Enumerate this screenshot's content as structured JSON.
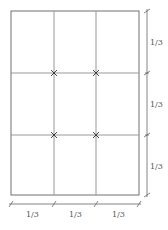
{
  "diagram": {
    "colors": {
      "background": "#ffffff",
      "frame": "#707070",
      "grid": "#999999",
      "dimension": "#666666",
      "cross": "#333333",
      "label": "#555555"
    },
    "frame": {
      "x": 11,
      "y": 11,
      "width": 128,
      "height": 184
    },
    "grid": {
      "columns": 3,
      "rows": 3,
      "vertical_lines_x": [
        54,
        96
      ],
      "horizontal_lines_y": [
        73,
        135
      ]
    },
    "intersections": [
      {
        "x": 54,
        "y": 73
      },
      {
        "x": 96,
        "y": 73
      },
      {
        "x": 54,
        "y": 135
      },
      {
        "x": 96,
        "y": 135
      }
    ],
    "vertical_dimension": {
      "x": 147,
      "ticks_y": [
        11,
        73,
        135,
        195
      ],
      "labels": [
        "1/3",
        "1/3",
        "1/3"
      ]
    },
    "horizontal_dimension": {
      "y": 204,
      "ticks_x": [
        11,
        54,
        96,
        139
      ],
      "labels": [
        "1/3",
        "1/3",
        "1/3"
      ]
    }
  }
}
